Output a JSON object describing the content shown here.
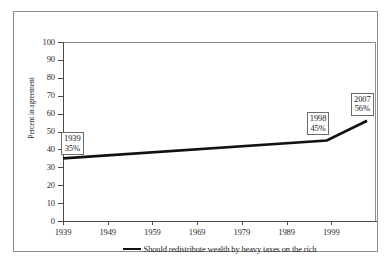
{
  "chart_data": {
    "type": "line",
    "title": "",
    "xlabel": "",
    "ylabel": "Percent in agreement",
    "xlim": [
      1939,
      2009
    ],
    "ylim": [
      0,
      100
    ],
    "grid": false,
    "legend_position": "bottom",
    "x_ticks": [
      "1939",
      "1949",
      "1959",
      "1969",
      "1979",
      "1989",
      "1999"
    ],
    "x_tick_values": [
      1939,
      1949,
      1959,
      1969,
      1979,
      1989,
      1999
    ],
    "y_ticks": [
      "0",
      "10",
      "20",
      "30",
      "40",
      "50",
      "60",
      "70",
      "80",
      "90",
      "100"
    ],
    "y_tick_values": [
      0,
      10,
      20,
      30,
      40,
      50,
      60,
      70,
      80,
      90,
      100
    ],
    "series": [
      {
        "name": "Should redistribute wealth by heavy taxes on the rich",
        "color": "#111111",
        "x": [
          1939,
          1998,
          2007
        ],
        "values": [
          35,
          45,
          56
        ]
      }
    ],
    "annotations": [
      {
        "year": "1939",
        "percent": "35%",
        "x": 1939,
        "y": 35
      },
      {
        "year": "1998",
        "percent": "45%",
        "x": 1998,
        "y": 45
      },
      {
        "year": "2007",
        "percent": "56%",
        "x": 2007,
        "y": 56
      }
    ]
  },
  "legend": {
    "entries": [
      {
        "label": "Should redistribute wealth by heavy taxes on the rich"
      }
    ]
  }
}
